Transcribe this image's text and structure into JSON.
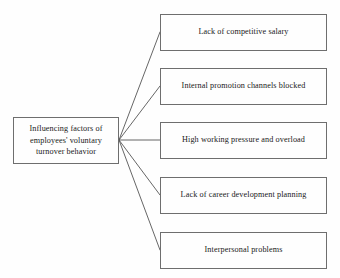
{
  "diagram": {
    "type": "fan-out-tree",
    "root": {
      "label": "Influencing factors of\nemployees' voluntary\nturnover behavior"
    },
    "factors": [
      {
        "label": "Lack of competitive salary"
      },
      {
        "label": "Internal promotion channels blocked"
      },
      {
        "label": "High working pressure and overload"
      },
      {
        "label": "Lack of career development planning"
      },
      {
        "label": "Interpersonal problems"
      }
    ],
    "style": {
      "background_color": "#fefefe",
      "border_color": "#6e6e6e",
      "text_color": "#1a1a1a",
      "connector_color": "#555555"
    },
    "connectors": {
      "junction_x": 119,
      "junction_y": 140,
      "endpoints": [
        {
          "x": 160,
          "y": 32
        },
        {
          "x": 160,
          "y": 86
        },
        {
          "x": 160,
          "y": 140
        },
        {
          "x": 160,
          "y": 195
        },
        {
          "x": 160,
          "y": 250
        }
      ]
    }
  }
}
